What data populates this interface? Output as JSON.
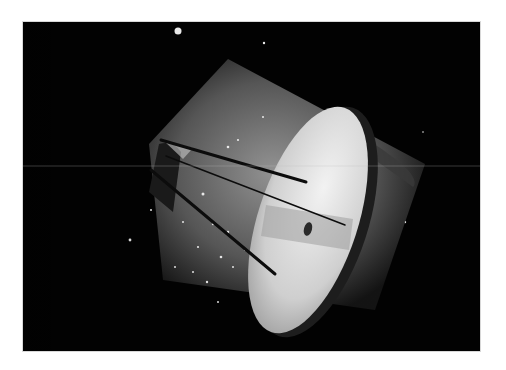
{
  "image": {
    "description": "Grayscale photograph of a cylindrical space capsule with a bright elliptical end cap and three thin antenna rods, set against a dark starfield",
    "alt": "Space capsule against a starfield",
    "colors": {
      "background": "#ffffff",
      "space": "#020202",
      "cap_highlight": "#e6e6e6",
      "hull": "#8a8a8a",
      "rod": "#111111"
    }
  }
}
